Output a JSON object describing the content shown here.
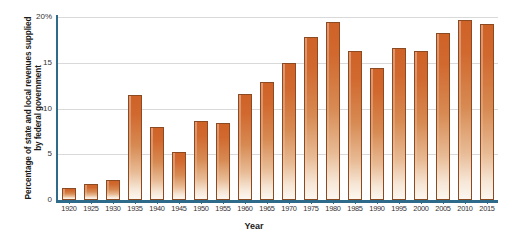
{
  "chart_data": {
    "type": "bar",
    "title": "",
    "xlabel": "Year",
    "ylabel": "Percentage of state and local revenues supplied by federal government",
    "categories": [
      "1920",
      "1925",
      "1930",
      "1935",
      "1940",
      "1945",
      "1950",
      "1955",
      "1960",
      "1965",
      "1970",
      "1975",
      "1980",
      "1985",
      "1990",
      "1995",
      "2000",
      "2005",
      "2010",
      "2015"
    ],
    "values": [
      1.3,
      1.7,
      2.2,
      11.5,
      8.0,
      5.3,
      8.6,
      8.4,
      11.6,
      12.9,
      15.0,
      17.8,
      19.5,
      16.3,
      14.4,
      16.6,
      16.3,
      18.3,
      19.7,
      19.2
    ],
    "ylim": [
      0,
      20
    ],
    "yticks": [
      "0",
      "5",
      "10",
      "15",
      "20%"
    ],
    "ytick_values": [
      0,
      5,
      10,
      15,
      20
    ],
    "grid": true,
    "legend": "none",
    "series_name": "Percentage of state and local revenues supplied by federal government",
    "bar_color_top": "#cf6227",
    "bar_color_bottom": "#fcf7f1",
    "bar_border_color": "#8c4a22",
    "axis_color": "#2e6b8a",
    "gridline_color": "#d9d9d9"
  }
}
